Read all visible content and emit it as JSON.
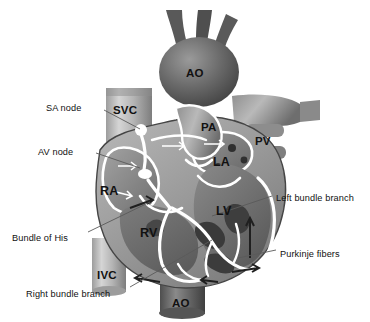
{
  "figure": {
    "background_color": "#ffffff",
    "text_color": "#111111",
    "style": "grayscale medical illustration"
  },
  "palette": {
    "aorta_dark": "#5f5f5f",
    "vessel_mid": "#8c8c8c",
    "vessel_light": "#c9c9c9",
    "myocardium": "#9a9a9a",
    "chamber_dark": "#6a6a6a",
    "chamber_darker": "#4a4a4a",
    "conduction_white": "#ffffff",
    "outline": "#3a3a3a",
    "leader_line": "#5a5a5a"
  },
  "leader_labels": [
    {
      "id": "sa-node",
      "text": "SA node",
      "x": 46,
      "y": 104,
      "anchor": "start",
      "line": [
        [
          104,
          110
        ],
        [
          140,
          129
        ]
      ]
    },
    {
      "id": "av-node",
      "text": "AV node",
      "x": 38,
      "y": 148,
      "anchor": "start",
      "line": [
        [
          96,
          153
        ],
        [
          140,
          168
        ]
      ]
    },
    {
      "id": "bundle-of-his",
      "text": "Bundle of His",
      "x": 12,
      "y": 234,
      "anchor": "start",
      "line": [
        [
          88,
          232
        ],
        [
          150,
          202
        ]
      ]
    },
    {
      "id": "right-bundle-branch",
      "text": "Right bundle branch",
      "x": 26,
      "y": 290,
      "anchor": "start",
      "line": [
        [
          130,
          287
        ],
        [
          212,
          240
        ]
      ]
    },
    {
      "id": "left-bundle-branch",
      "text": "Left bundle branch",
      "x": 276,
      "y": 194,
      "anchor": "start",
      "line": [
        [
          272,
          196
        ],
        [
          212,
          216
        ]
      ]
    },
    {
      "id": "purkinje-fibers",
      "text": "Purkinje fibers",
      "x": 280,
      "y": 250,
      "anchor": "start",
      "line": [
        [
          276,
          250
        ],
        [
          238,
          258
        ]
      ]
    }
  ],
  "structure_labels": [
    {
      "id": "ao-arch",
      "text": "AO",
      "x": 186,
      "y": 68,
      "kind": "vessel",
      "name": "aorta"
    },
    {
      "id": "svc",
      "text": "SVC",
      "x": 113,
      "y": 105,
      "kind": "vessel",
      "name": "superior-vena-cava"
    },
    {
      "id": "pa",
      "text": "PA",
      "x": 201,
      "y": 122,
      "kind": "vessel",
      "name": "pulmonary-artery"
    },
    {
      "id": "pv",
      "text": "PV",
      "x": 255,
      "y": 136,
      "kind": "vessel",
      "name": "pulmonary-veins"
    },
    {
      "id": "la",
      "text": "LA",
      "x": 213,
      "y": 156,
      "kind": "chamber",
      "name": "left-atrium"
    },
    {
      "id": "ra",
      "text": "RA",
      "x": 100,
      "y": 185,
      "kind": "chamber",
      "name": "right-atrium"
    },
    {
      "id": "lv",
      "text": "LV",
      "x": 216,
      "y": 205,
      "kind": "chamber",
      "name": "left-ventricle"
    },
    {
      "id": "rv",
      "text": "RV",
      "x": 140,
      "y": 227,
      "kind": "chamber",
      "name": "right-ventricle"
    },
    {
      "id": "ivc",
      "text": "IVC",
      "x": 97,
      "y": 270,
      "kind": "vessel",
      "name": "inferior-vena-cava"
    },
    {
      "id": "ao-descend",
      "text": "AO",
      "x": 172,
      "y": 298,
      "kind": "vessel",
      "name": "descending-aorta"
    }
  ]
}
